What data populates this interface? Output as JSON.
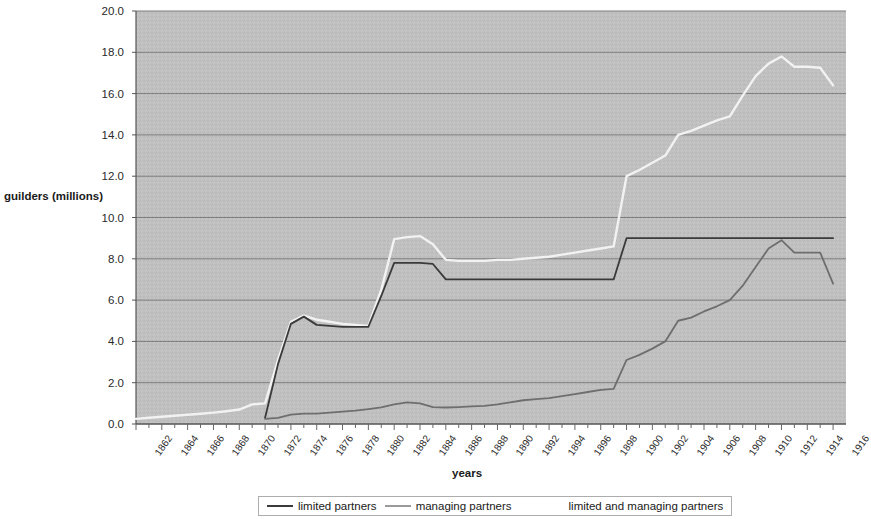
{
  "chart_data": {
    "type": "line",
    "title": "",
    "xlabel": "years",
    "ylabel": "guilders (millions)",
    "xlim": [
      1862,
      1917
    ],
    "ylim": [
      0.0,
      20.0
    ],
    "ytick_step": 2.0,
    "grid": true,
    "legend_position": "bottom",
    "plot_background": "#c0c0c0",
    "ytick_labels": [
      "0.0",
      "2.0",
      "4.0",
      "6.0",
      "8.0",
      "10.0",
      "12.0",
      "14.0",
      "16.0",
      "18.0",
      "20.0"
    ],
    "ytick_values": [
      0.0,
      2.0,
      4.0,
      6.0,
      8.0,
      10.0,
      12.0,
      14.0,
      16.0,
      18.0,
      20.0
    ],
    "xtick_labels": [
      "1862",
      "1864",
      "1866",
      "1868",
      "1870",
      "1872",
      "1874",
      "1876",
      "1878",
      "1880",
      "1882",
      "1884",
      "1886",
      "1888",
      "1890",
      "1892",
      "1894",
      "1896",
      "1898",
      "1900",
      "1902",
      "1904",
      "1906",
      "1908",
      "1910",
      "1912",
      "1914",
      "1916"
    ],
    "xtick_values": [
      1862,
      1864,
      1866,
      1868,
      1870,
      1872,
      1874,
      1876,
      1878,
      1880,
      1882,
      1884,
      1886,
      1888,
      1890,
      1892,
      1894,
      1896,
      1898,
      1900,
      1902,
      1904,
      1906,
      1908,
      1910,
      1912,
      1914,
      1916
    ],
    "x": [
      1862,
      1863,
      1864,
      1865,
      1866,
      1867,
      1868,
      1869,
      1870,
      1871,
      1872,
      1873,
      1874,
      1875,
      1876,
      1877,
      1878,
      1879,
      1880,
      1881,
      1882,
      1883,
      1884,
      1885,
      1886,
      1887,
      1888,
      1889,
      1890,
      1891,
      1892,
      1893,
      1894,
      1895,
      1896,
      1897,
      1898,
      1899,
      1900,
      1901,
      1902,
      1903,
      1904,
      1905,
      1906,
      1907,
      1908,
      1909,
      1910,
      1911,
      1912,
      1913,
      1914,
      1915,
      1916
    ],
    "series": [
      {
        "name": "limited partners",
        "color": "#6e6e6e",
        "values": [
          null,
          null,
          null,
          null,
          null,
          null,
          null,
          null,
          null,
          null,
          0.25,
          0.3,
          0.45,
          0.5,
          0.5,
          0.55,
          0.6,
          0.65,
          0.72,
          0.8,
          0.95,
          1.05,
          1.0,
          0.82,
          0.8,
          0.82,
          0.85,
          0.88,
          0.95,
          1.05,
          1.15,
          1.2,
          1.25,
          1.35,
          1.45,
          1.55,
          1.65,
          1.7,
          3.1,
          3.35,
          3.65,
          4.0,
          5.0,
          5.15,
          5.45,
          5.7,
          6.0,
          6.7,
          7.6,
          8.5,
          8.9,
          8.3,
          8.3,
          8.3,
          6.8
        ]
      },
      {
        "name": "managing partners",
        "color": "#f2f2f2",
        "values": [
          0.25,
          0.3,
          0.35,
          0.4,
          0.45,
          0.5,
          0.55,
          0.62,
          0.7,
          0.95,
          1.0,
          3.1,
          4.95,
          5.25,
          5.05,
          4.95,
          4.85,
          4.8,
          4.75,
          6.5,
          8.95,
          9.05,
          9.1,
          8.7,
          7.95,
          7.9,
          7.9,
          7.9,
          7.95,
          7.95,
          8.0,
          8.05,
          8.1,
          8.2,
          8.3,
          8.4,
          8.5,
          8.6,
          12.0,
          12.3,
          12.65,
          13.0,
          14.0,
          14.2,
          14.45,
          14.7,
          14.9,
          15.9,
          16.85,
          17.45,
          17.8,
          17.3,
          17.3,
          17.25,
          16.4
        ]
      },
      {
        "name": "limited and managing partners",
        "color": "#3a3a3a",
        "values": [
          null,
          null,
          null,
          null,
          null,
          null,
          null,
          null,
          null,
          null,
          0.3,
          2.9,
          4.85,
          5.2,
          4.8,
          4.75,
          4.7,
          4.7,
          4.7,
          6.2,
          7.8,
          7.8,
          7.8,
          7.75,
          7.0,
          7.0,
          7.0,
          7.0,
          7.0,
          7.0,
          7.0,
          7.0,
          7.0,
          7.0,
          7.0,
          7.0,
          7.0,
          7.0,
          9.0,
          9.0,
          9.0,
          9.0,
          9.0,
          9.0,
          9.0,
          9.0,
          9.0,
          9.0,
          9.0,
          9.0,
          9.0,
          9.0,
          9.0,
          9.0,
          9.0
        ]
      }
    ]
  },
  "legend": {
    "entries": [
      {
        "label": "limited partners",
        "color": "#3a3a3a",
        "has_swatch": true
      },
      {
        "label": "managing partners",
        "color": "#9a9a9a",
        "has_swatch": true
      },
      {
        "label": "limited and managing partners",
        "color": "#6e6e6e",
        "has_swatch": false
      }
    ]
  }
}
